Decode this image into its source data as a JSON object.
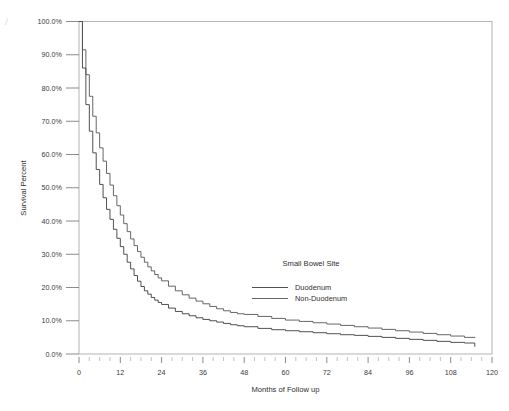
{
  "chart_data": {
    "type": "line",
    "title": "",
    "xlabel": "Months of Follow up",
    "ylabel": "Survival Percent",
    "xlim": [
      0,
      120
    ],
    "ylim": [
      0,
      100
    ],
    "xticks": [
      "0",
      "12",
      "24",
      "36",
      "48",
      "60",
      "72",
      "84",
      "96",
      "108",
      "120"
    ],
    "xtick_values": [
      0,
      12,
      24,
      36,
      48,
      60,
      72,
      84,
      96,
      108,
      120
    ],
    "yticks": [
      "0.0%",
      "10.0%",
      "20.0%",
      "30.0%",
      "40.0%",
      "50.0%",
      "60.0%",
      "70.0%",
      "80.0%",
      "90.0%",
      "100.0%"
    ],
    "ytick_values": [
      0,
      10,
      20,
      30,
      40,
      50,
      60,
      70,
      80,
      90,
      100
    ],
    "grid": false,
    "legend_position": "center",
    "legend_title": "Small Bowel Site",
    "x": [
      0,
      1,
      2,
      3,
      4,
      5,
      6,
      7,
      8,
      9,
      10,
      11,
      12,
      13,
      14,
      15,
      16,
      17,
      18,
      19,
      20,
      21,
      22,
      23,
      24,
      26,
      28,
      30,
      32,
      34,
      36,
      38,
      40,
      42,
      44,
      46,
      48,
      52,
      56,
      60,
      64,
      68,
      72,
      76,
      80,
      84,
      88,
      92,
      96,
      100,
      104,
      108,
      112,
      115
    ],
    "series": [
      {
        "name": "Duodenum",
        "color": "#3c3c3c",
        "values": [
          100.0,
          86.0,
          75.0,
          67.0,
          60.5,
          55.5,
          51.0,
          47.0,
          43.5,
          40.5,
          37.5,
          34.8,
          32.3,
          30.0,
          27.6,
          25.6,
          23.6,
          21.9,
          20.3,
          19.0,
          18.0,
          17.0,
          16.2,
          15.5,
          14.9,
          13.8,
          12.8,
          12.1,
          11.5,
          10.9,
          10.4,
          10.0,
          9.6,
          9.2,
          8.8,
          8.5,
          8.2,
          7.7,
          7.3,
          7.0,
          6.7,
          6.4,
          6.1,
          5.8,
          5.6,
          5.3,
          5.0,
          4.7,
          4.4,
          4.1,
          3.8,
          3.5,
          3.3,
          2.2
        ]
      },
      {
        "name": "Non-Duodenum",
        "color": "#555555",
        "values": [
          100.0,
          91.5,
          84.0,
          77.5,
          71.5,
          66.5,
          62.0,
          58.0,
          54.3,
          50.8,
          47.6,
          44.6,
          41.8,
          39.2,
          36.8,
          34.6,
          32.6,
          30.8,
          29.1,
          27.6,
          26.2,
          25.0,
          23.9,
          22.9,
          22.0,
          20.4,
          19.0,
          17.8,
          16.8,
          15.9,
          15.1,
          14.3,
          13.6,
          13.0,
          12.5,
          12.1,
          11.9,
          11.3,
          10.7,
          10.2,
          9.8,
          9.4,
          9.0,
          8.6,
          8.2,
          7.8,
          7.4,
          7.0,
          6.6,
          6.2,
          5.8,
          5.4,
          5.0,
          4.8
        ]
      }
    ]
  },
  "legend": {
    "title": "Small Bowel Site",
    "entries": [
      {
        "label": "Duodenum"
      },
      {
        "label": "Non-Duodenum"
      }
    ]
  },
  "axes": {
    "x_title": "Months of Follow up",
    "y_title": "Survival Percent"
  },
  "artifact": {
    "mark": "/"
  }
}
